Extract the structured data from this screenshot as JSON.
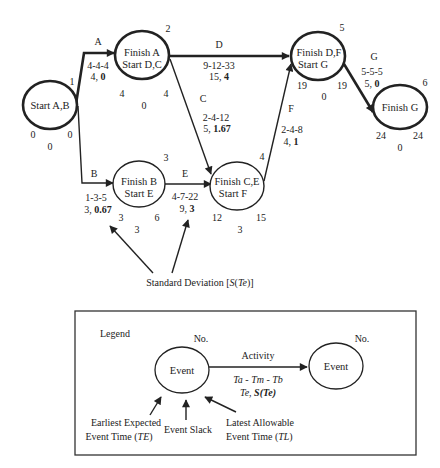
{
  "network": {
    "nodes": [
      {
        "id": 1,
        "number": "1",
        "line1": "Start A,B",
        "line2": "",
        "te": "0",
        "tl": "0",
        "slack": "0"
      },
      {
        "id": 2,
        "number": "2",
        "line1": "Finish A",
        "line2": "Start D,C",
        "te": "4",
        "tl": "4",
        "slack": "0"
      },
      {
        "id": 3,
        "number": "3",
        "line1": "Finish B",
        "line2": "Start E",
        "te": "3",
        "tl": "6",
        "slack": "3"
      },
      {
        "id": 4,
        "number": "4",
        "line1": "Finish C,E",
        "line2": "Start F",
        "te": "12",
        "tl": "15",
        "slack": "3"
      },
      {
        "id": 5,
        "number": "5",
        "line1": "Finish D,F",
        "line2": "Start G",
        "te": "19",
        "tl": "19",
        "slack": "0"
      },
      {
        "id": 6,
        "number": "6",
        "line1": "Finish G",
        "line2": "",
        "te": "24",
        "tl": "24",
        "slack": "0"
      }
    ],
    "activities": [
      {
        "name": "A",
        "times": "4-4-4",
        "te": "4,",
        "sd": "0",
        "critical": true
      },
      {
        "name": "B",
        "times": "1-3-5",
        "te": "3,",
        "sd": "0.67",
        "critical": false
      },
      {
        "name": "C",
        "times": "2-4-12",
        "te": "5,",
        "sd": "1.67",
        "critical": false
      },
      {
        "name": "D",
        "times": "9-12-33",
        "te": "15,",
        "sd": "4",
        "critical": true
      },
      {
        "name": "E",
        "times": "4-7-22",
        "te": "9,",
        "sd": "3",
        "critical": false
      },
      {
        "name": "F",
        "times": "2-4-8",
        "te": "4,",
        "sd": "1",
        "critical": false
      },
      {
        "name": "G",
        "times": "5-5-5",
        "te": "5,",
        "sd": "0",
        "critical": true
      }
    ],
    "sd_callout": {
      "prefix": "Standard Deviation [",
      "s": "S",
      "open": "(",
      "te": "Te",
      "close": ")]"
    }
  },
  "legend": {
    "title": "Legend",
    "no_left": "No.",
    "no_right": "No.",
    "event_left": "Event",
    "event_right": "Event",
    "activity": "Activity",
    "times_formula": "Ta - Tm - Tb",
    "te_formula_a": "Te, ",
    "te_formula_b": "S(Te)",
    "earliest_1": "Earliest Expected",
    "earliest_2a": "Event Time (",
    "earliest_2b": "TE",
    "earliest_2c": ")",
    "slack": "Event Slack",
    "latest_1": "Latest Allowable",
    "latest_2a": "Event Time (",
    "latest_2b": "TL",
    "latest_2c": ")"
  }
}
